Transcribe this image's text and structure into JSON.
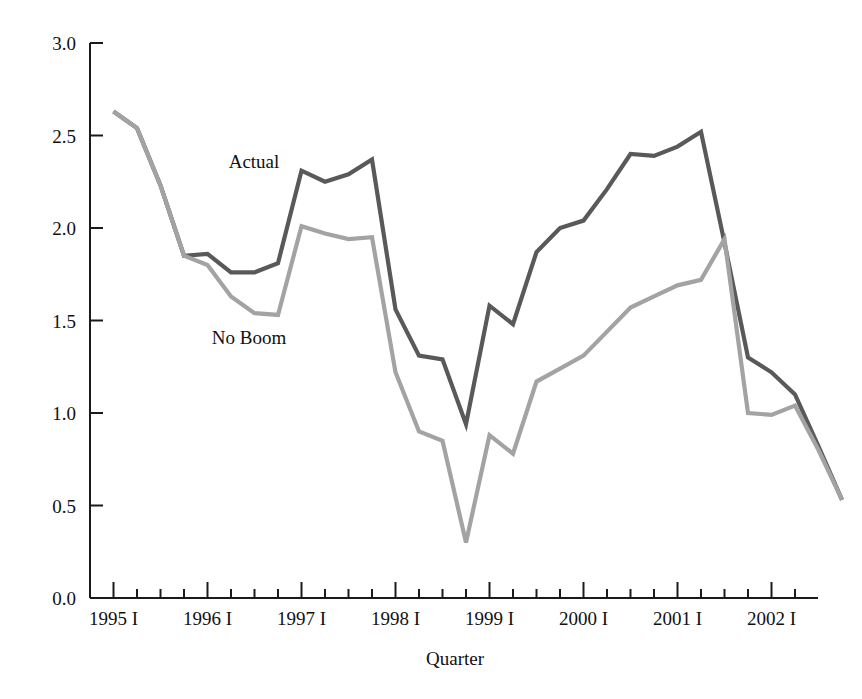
{
  "chart_data": {
    "type": "line",
    "title": "",
    "subtitle": "",
    "xlabel": "Quarter",
    "ylabel": "",
    "grid": false,
    "legend_position": "inline-annotation",
    "ylim": [
      0.0,
      3.0
    ],
    "yticks": [
      "0.0",
      "0.5",
      "1.0",
      "1.5",
      "2.0",
      "2.5",
      "3.0"
    ],
    "ytick_values": [
      0.0,
      0.5,
      1.0,
      1.5,
      2.0,
      2.5,
      3.0
    ],
    "xtick_labels": [
      "1995 I",
      "1996 I",
      "1997 I",
      "1998 I",
      "1999 I",
      "2000 I",
      "2001 I",
      "2002 I"
    ],
    "x": [
      "1995 I",
      "1995 II",
      "1995 III",
      "1995 IV",
      "1996 I",
      "1996 II",
      "1996 III",
      "1996 IV",
      "1997 I",
      "1997 II",
      "1997 III",
      "1997 IV",
      "1998 I",
      "1998 II",
      "1998 III",
      "1998 IV",
      "1999 I",
      "1999 II",
      "1999 III",
      "1999 IV",
      "2000 I",
      "2000 II",
      "2000 III",
      "2000 IV",
      "2001 I",
      "2001 II",
      "2001 III",
      "2001 IV",
      "2002 I",
      "2002 II",
      "2002 III",
      "2002 IV"
    ],
    "series": [
      {
        "name": "Actual",
        "color": "#595959",
        "values": [
          2.63,
          2.54,
          2.23,
          1.85,
          1.86,
          1.76,
          1.76,
          1.81,
          2.31,
          2.25,
          2.29,
          2.37,
          1.56,
          1.31,
          1.29,
          0.94,
          1.58,
          1.48,
          1.87,
          2.0,
          2.04,
          2.21,
          2.4,
          2.39,
          2.44,
          2.52,
          1.92,
          1.3,
          1.22,
          1.1,
          0.82,
          0.53
        ]
      },
      {
        "name": "No Boom",
        "color": "#a3a3a3",
        "values": [
          2.63,
          2.54,
          2.23,
          1.85,
          1.8,
          1.63,
          1.54,
          1.53,
          2.01,
          1.97,
          1.94,
          1.95,
          1.22,
          0.9,
          0.85,
          0.3,
          0.88,
          0.78,
          1.17,
          1.24,
          1.31,
          1.44,
          1.57,
          1.63,
          1.69,
          1.72,
          1.94,
          1.0,
          0.99,
          1.04,
          0.8,
          0.53
        ]
      }
    ],
    "annotations": [
      {
        "text": "Actual",
        "series": "Actual",
        "x_px": 254,
        "y_px": 168
      },
      {
        "text": "No Boom",
        "series": "No Boom",
        "x_px": 249,
        "y_px": 344
      }
    ]
  },
  "geometry": {
    "plot_left": 90,
    "plot_right": 818,
    "plot_top": 43,
    "plot_bottom": 598,
    "tick_spacing": 23.5,
    "tick_len_short": 9,
    "tick_len_long": 16
  },
  "axis_title": "Quarter"
}
